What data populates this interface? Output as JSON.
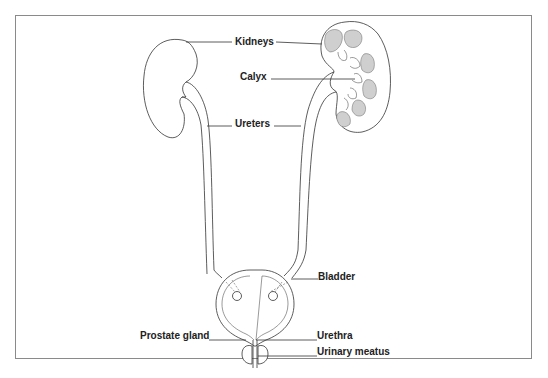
{
  "diagram": {
    "labels": {
      "kidneys": "Kidneys",
      "calyx": "Calyx",
      "ureters": "Ureters",
      "bladder": "Bladder",
      "prostate_gland": "Prostate gland",
      "urethra": "Urethra",
      "urinary_meatus": "Urinary meatus"
    },
    "colors": {
      "line": "#333333",
      "frame": "#8a8a8a",
      "background": "#ffffff"
    }
  }
}
